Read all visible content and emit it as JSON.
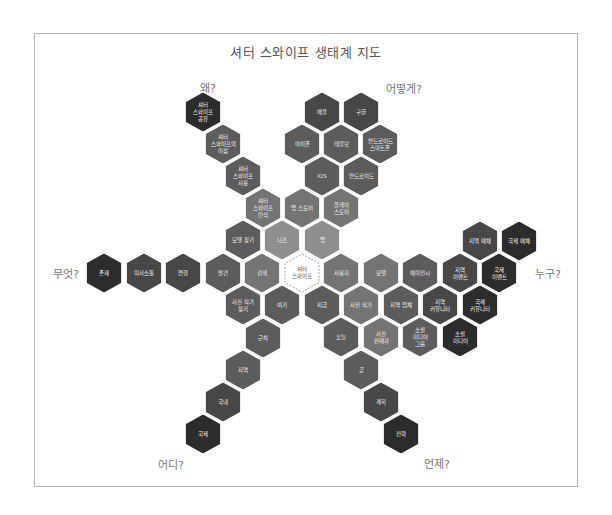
{
  "title": "셔터 스와이프 생태계 지도",
  "colors": {
    "L1": "#8e8e8e",
    "L2": "#747474",
    "L3": "#5c5c5c",
    "L4": "#474747",
    "L5": "#2c2c2c",
    "center_border": "#888888"
  },
  "questions": [
    {
      "label": "왜?",
      "x": 208,
      "y": 87
    },
    {
      "label": "어떻게?",
      "x": 404,
      "y": 88
    },
    {
      "label": "무엇?",
      "x": 66,
      "y": 273
    },
    {
      "label": "누구?",
      "x": 548,
      "y": 273
    },
    {
      "label": "어디?",
      "x": 171,
      "y": 464
    },
    {
      "label": "언제?",
      "x": 437,
      "y": 463
    }
  ],
  "center": {
    "label": "셔터\n스와이프",
    "x": 302,
    "y": 273
  },
  "hexes": [
    {
      "label": "셔터\n스와이프\n공유",
      "x": 203,
      "y": 112,
      "shade": "L5",
      "branch": "why"
    },
    {
      "label": "셔터\n스와이프의\n이점",
      "x": 223,
      "y": 144,
      "shade": "L3",
      "branch": "why"
    },
    {
      "label": "셔터\n스와이프\n사용",
      "x": 243,
      "y": 176,
      "shade": "L3",
      "branch": "why"
    },
    {
      "label": "셔터\n스와이프\n인식",
      "x": 263,
      "y": 208,
      "shade": "L2",
      "branch": "why"
    },
    {
      "label": "모델 찾기",
      "x": 243,
      "y": 240,
      "shade": "L3",
      "branch": "why"
    },
    {
      "label": "니즈",
      "x": 282,
      "y": 240,
      "shade": "L1",
      "branch": "why"
    },
    {
      "label": "애플",
      "x": 322,
      "y": 112,
      "shade": "L4",
      "branch": "how"
    },
    {
      "label": "구글",
      "x": 361,
      "y": 112,
      "shade": "L4",
      "branch": "how"
    },
    {
      "label": "아이폰",
      "x": 302,
      "y": 144,
      "shade": "L3",
      "branch": "how"
    },
    {
      "label": "태블릿",
      "x": 341,
      "y": 144,
      "shade": "L3",
      "branch": "how"
    },
    {
      "label": "안드로이드\n스마트폰",
      "x": 380,
      "y": 144,
      "shade": "L3",
      "branch": "how"
    },
    {
      "label": "iOS",
      "x": 322,
      "y": 176,
      "shade": "L3",
      "branch": "how"
    },
    {
      "label": "안드로이드",
      "x": 361,
      "y": 176,
      "shade": "L3",
      "branch": "how"
    },
    {
      "label": "앱 스토어",
      "x": 302,
      "y": 208,
      "shade": "L2",
      "branch": "how"
    },
    {
      "label": "플레이\n스토어",
      "x": 341,
      "y": 208,
      "shade": "L2",
      "branch": "how"
    },
    {
      "label": "앱",
      "x": 322,
      "y": 240,
      "shade": "L1",
      "branch": "how"
    },
    {
      "label": "존재",
      "x": 104,
      "y": 273,
      "shade": "L5",
      "branch": "what"
    },
    {
      "label": "의사소통",
      "x": 144,
      "y": 273,
      "shade": "L4",
      "branch": "what"
    },
    {
      "label": "연결",
      "x": 183,
      "y": 273,
      "shade": "L4",
      "branch": "what"
    },
    {
      "label": "발견",
      "x": 223,
      "y": 273,
      "shade": "L3",
      "branch": "what"
    },
    {
      "label": "검색",
      "x": 262,
      "y": 273,
      "shade": "L2",
      "branch": "what"
    },
    {
      "label": "사용자",
      "x": 341,
      "y": 273,
      "shade": "L2",
      "branch": "who"
    },
    {
      "label": "모델",
      "x": 381,
      "y": 273,
      "shade": "L2",
      "branch": "who"
    },
    {
      "label": "에이전시",
      "x": 420,
      "y": 273,
      "shade": "L3",
      "branch": "who"
    },
    {
      "label": "지역\n이벤트",
      "x": 460,
      "y": 273,
      "shade": "L4",
      "branch": "who"
    },
    {
      "label": "국제\n이벤트",
      "x": 499,
      "y": 273,
      "shade": "L5",
      "branch": "who"
    },
    {
      "label": "지역 매체",
      "x": 480,
      "y": 241,
      "shade": "L4",
      "branch": "who"
    },
    {
      "label": "국제 매체",
      "x": 519,
      "y": 241,
      "shade": "L5",
      "branch": "who"
    },
    {
      "label": "사진 작가",
      "x": 361,
      "y": 305,
      "shade": "L2",
      "branch": "who"
    },
    {
      "label": "지역 업체",
      "x": 401,
      "y": 305,
      "shade": "L3",
      "branch": "who"
    },
    {
      "label": "지역\n커뮤니티",
      "x": 440,
      "y": 305,
      "shade": "L4",
      "branch": "who"
    },
    {
      "label": "국제\n커뮤니티",
      "x": 480,
      "y": 305,
      "shade": "L5",
      "branch": "who"
    },
    {
      "label": "사진\n판매자",
      "x": 381,
      "y": 337,
      "shade": "L2",
      "branch": "who"
    },
    {
      "label": "소셜\n미디어\n그룹",
      "x": 420,
      "y": 337,
      "shade": "L3",
      "branch": "who"
    },
    {
      "label": "소셜\n미디어",
      "x": 460,
      "y": 337,
      "shade": "L5",
      "branch": "who"
    },
    {
      "label": "사진 작가\n찾기",
      "x": 243,
      "y": 305,
      "shade": "L3",
      "branch": "where"
    },
    {
      "label": "여기",
      "x": 282,
      "y": 305,
      "shade": "L3",
      "branch": "where"
    },
    {
      "label": "근처",
      "x": 263,
      "y": 338,
      "shade": "L3",
      "branch": "where"
    },
    {
      "label": "지역",
      "x": 243,
      "y": 370,
      "shade": "L3",
      "branch": "where"
    },
    {
      "label": "국내",
      "x": 223,
      "y": 402,
      "shade": "L4",
      "branch": "where"
    },
    {
      "label": "국제",
      "x": 203,
      "y": 434,
      "shade": "L5",
      "branch": "where"
    },
    {
      "label": "지금",
      "x": 322,
      "y": 305,
      "shade": "L3",
      "branch": "when"
    },
    {
      "label": "오늘",
      "x": 341,
      "y": 337,
      "shade": "L3",
      "branch": "when"
    },
    {
      "label": "곧",
      "x": 361,
      "y": 370,
      "shade": "L3",
      "branch": "when"
    },
    {
      "label": "계획",
      "x": 381,
      "y": 402,
      "shade": "L4",
      "branch": "when"
    },
    {
      "label": "전략",
      "x": 401,
      "y": 434,
      "shade": "L5",
      "branch": "when"
    }
  ]
}
